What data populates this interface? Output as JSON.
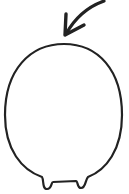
{
  "illustration": {
    "subject": "round-creature-with-feet",
    "pointer": "curved-arrow-pointing-down",
    "stroke_color": "#222222",
    "background_color": "#ffffff"
  }
}
